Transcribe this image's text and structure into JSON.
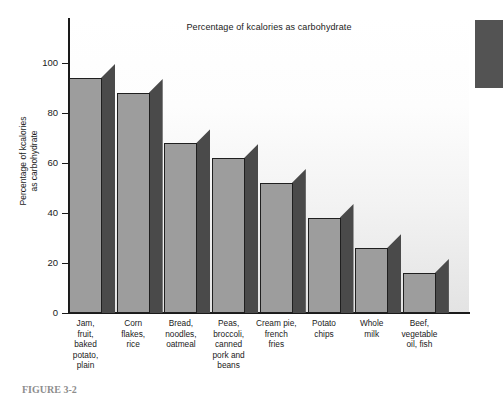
{
  "chart_data": {
    "type": "bar",
    "title": "Percentage of kcalories as carbohydrate",
    "xlabel": "",
    "ylabel": "Percentage of kcalories as carbohydrate",
    "ylabel_line1": "Percentage of kcalories",
    "ylabel_line2": "as carbohydrate",
    "ylim": [
      0,
      110
    ],
    "yticks": [
      0,
      20,
      40,
      60,
      80,
      100
    ],
    "grid": false,
    "legend": "none",
    "categories": [
      "Jam,\nfruit,\nbaked\npotato,\nplain",
      "Corn\nflakes,\nrice",
      "Bread,\nnoodles,\noatmeal",
      "Peas,\nbroccoli,\ncanned\npork and\nbeans",
      "Cream pie,\nfrench\nfries",
      "Potato\nchips",
      "Whole\nmilk",
      "Beef,\nvegetable\noil, fish"
    ],
    "category_lines": [
      [
        "Jam,",
        "fruit,",
        "baked",
        "potato,",
        "plain"
      ],
      [
        "Corn",
        "flakes,",
        "rice"
      ],
      [
        "Bread,",
        "noodles,",
        "oatmeal"
      ],
      [
        "Peas,",
        "broccoli,",
        "canned",
        "pork and",
        "beans"
      ],
      [
        "Cream pie,",
        "french",
        "fries"
      ],
      [
        "Potato",
        "chips"
      ],
      [
        "Whole",
        "milk"
      ],
      [
        "Beef,",
        "vegetable",
        "oil, fish"
      ]
    ],
    "values": [
      94,
      88,
      68,
      62,
      52,
      38,
      26,
      16
    ],
    "colors": {
      "bar_face": "#9d9d9d",
      "bar_side": "#4a4a4a",
      "bar_outline": "#1f1f1f",
      "axis": "#1a1a1a",
      "text": "#1a1a1a",
      "backdrop_top": "#ffffff",
      "backdrop_bottom": "#e3e3e3"
    }
  },
  "figure": {
    "caption": "FIGURE 3-2"
  }
}
